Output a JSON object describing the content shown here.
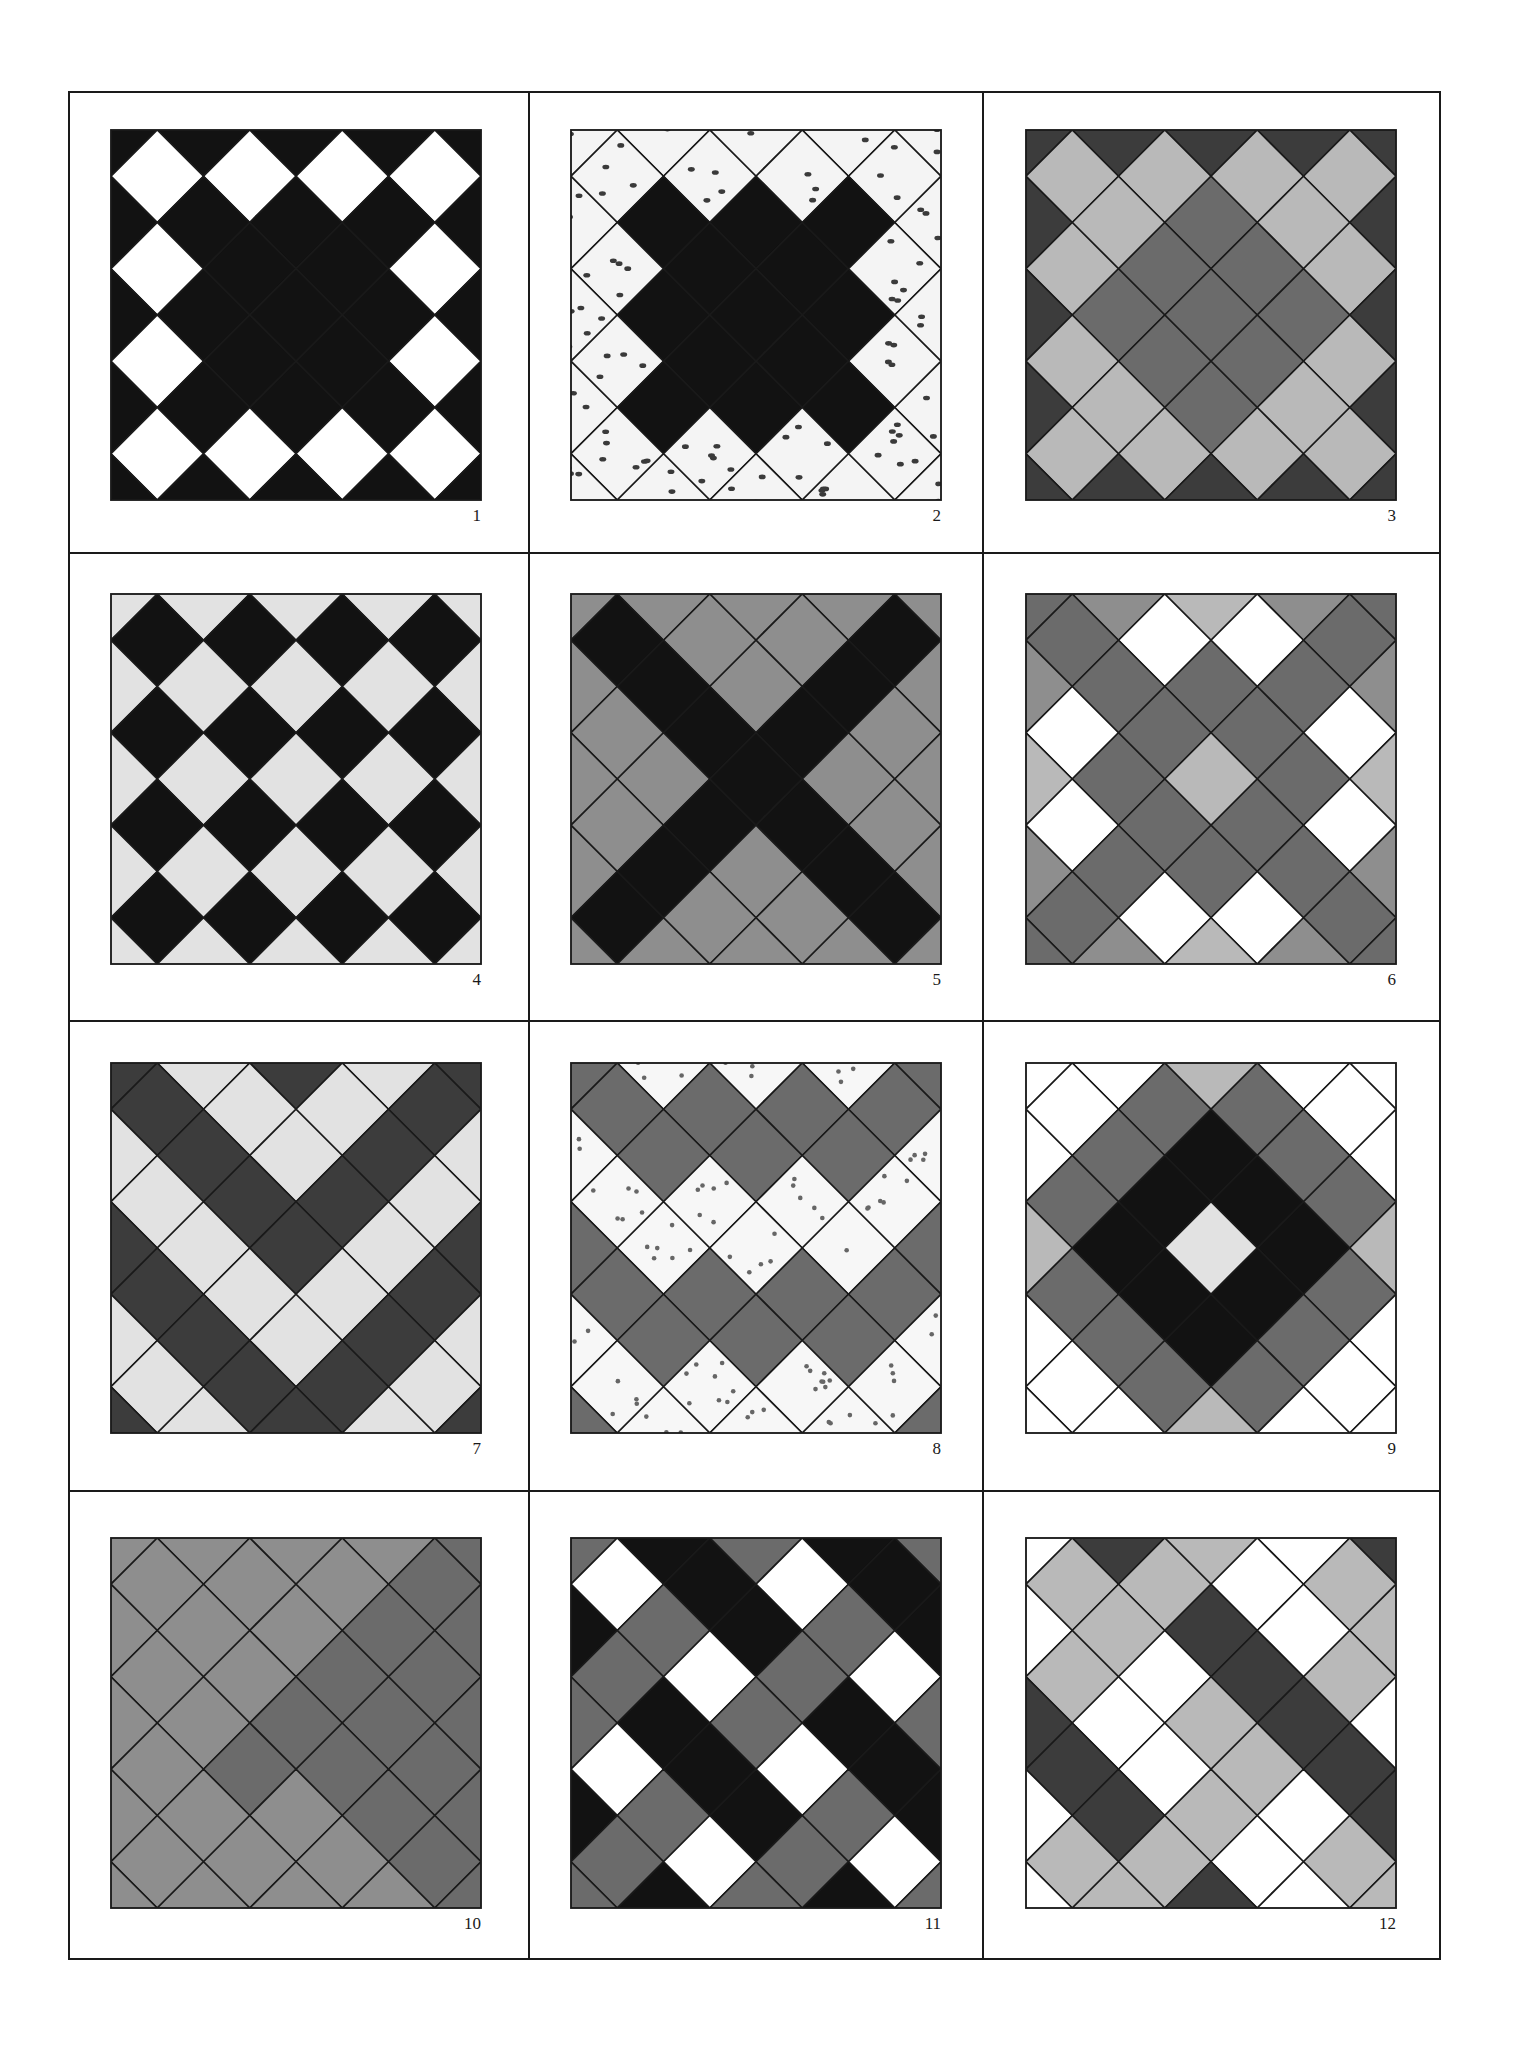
{
  "figure": {
    "palette": {
      "K": "#121212",
      "D": "#3c3c3c",
      "M": "#6b6b6b",
      "G": "#8e8e8e",
      "L": "#b9b9b9",
      "P": "#e2e2e2",
      "W": "#ffffff",
      "S": "#f4f4f4",
      "T": "#f7f7f7"
    },
    "legend_note": "Grid rows list lattice cells u=0..8 at row v; '.' = no cell at that lattice point",
    "tiles": [
      {
        "number": "1",
        "pattern": "black ground with ring of white diamonds",
        "rows": [
          "K.K.K.K.K",
          ".W.W.W.W.",
          "K.K.K.K.K",
          ".W.K.K.W.",
          "K.K.K.K.K",
          ".W.K.K.W.",
          "K.K.K.K.K",
          ".W.W.W.W.",
          "K.K.K.K.K"
        ]
      },
      {
        "number": "2",
        "pattern": "dark cross on spotted ground",
        "rows": [
          "S.S.S.S.S",
          ".S.S.S.S.",
          "S.K.K.K.S",
          ".S.K.K.S.",
          "S.K.K.K.S",
          ".S.K.K.S.",
          "S.K.K.K.S",
          ".S.S.S.S.",
          "S.S.S.S.S"
        ]
      },
      {
        "number": "3",
        "pattern": "grey diamond center with light ring on dark edges",
        "rows": [
          "D.D.D.D.D",
          ".L.L.L.L.",
          "D.L.M.L.D",
          ".L.M.M.L.",
          "D.M.M.M.D",
          ".L.M.M.L.",
          "D.L.M.L.D",
          ".L.L.L.L.",
          "D.D.D.D.D"
        ]
      },
      {
        "number": "4",
        "pattern": "black and light checkerboard",
        "rows": [
          "P.P.P.P.P",
          ".K.K.K.K.",
          "P.P.P.P.P",
          ".K.K.K.K.",
          "P.P.P.P.P",
          ".K.K.K.K.",
          "P.P.P.P.P",
          ".K.K.K.K.",
          "P.P.P.P.P"
        ]
      },
      {
        "number": "5",
        "pattern": "black X on grey ground",
        "rows": [
          "G.G.G.G.G",
          ".K.G.G.K.",
          "G.K.G.K.G",
          ".G.K.K.G.",
          "G.G.K.G.G",
          ".G.K.K.G.",
          "G.K.G.K.G",
          ".K.G.G.K.",
          "G.G.G.G.G"
        ]
      },
      {
        "number": "6",
        "pattern": "double grey X lattice with white diamonds",
        "rows": [
          "M.G.L.G.M",
          ".M.W.W.M.",
          "G.M.M.M.G",
          ".W.M.M.W.",
          "L.M.L.M.L",
          ".W.M.M.W.",
          "G.M.M.M.G",
          ".M.W.W.M.",
          "M.G.L.G.M"
        ]
      },
      {
        "number": "7",
        "pattern": "nested chevrons",
        "rows": [
          "D.P.D.P.D",
          ".D.P.P.D.",
          "P.D.P.D.P",
          ".P.D.D.P.",
          "D.P.D.P.D",
          ".D.P.P.D.",
          "P.D.P.D.P",
          ".P.D.D.P.",
          "D.P.D.P.D"
        ]
      },
      {
        "number": "8",
        "pattern": "two zigzag bands on spotted ground",
        "rows": [
          "M.T.T.T.M",
          ".M.M.M.M.",
          "T.M.M.M.T",
          ".T.T.T.T.",
          "M.T.T.T.M",
          ".M.M.M.M.",
          "T.M.M.M.T",
          ".T.T.T.T.",
          "M.T.T.T.M"
        ]
      },
      {
        "number": "9",
        "pattern": "concentric diamond rings",
        "rows": [
          "W.W.L.W.W",
          ".W.M.M.W.",
          "W.M.K.M.W",
          ".M.K.K.M.",
          "L.K.P.K.L",
          ".M.K.K.M.",
          "W.M.K.M.W",
          ".W.M.M.W.",
          "W.W.L.W.W"
        ]
      },
      {
        "number": "10",
        "pattern": "grey field with darker diagonal corner",
        "rows": [
          "G.G.G.G.M",
          ".G.G.G.M.",
          "G.G.G.M.M",
          ".G.G.M.M.",
          "G.G.M.M.M",
          ".G.M.M.M.",
          "G.G.G.M.M",
          ".G.G.G.M.",
          "G.G.G.G.M"
        ]
      },
      {
        "number": "11",
        "pattern": "woven plaid of black, grey and white",
        "rows": [
          "M.K.M.K.M",
          ".W.K.W.K.",
          "K.M.K.M.K",
          ".M.W.M.W.",
          "M.K.M.K.M",
          ".W.K.W.K.",
          "K.M.K.M.K",
          ".M.W.M.W.",
          "M.K.M.K.M"
        ]
      },
      {
        "number": "12",
        "pattern": "dark diagonal bands through light plaid",
        "rows": [
          "W.D.L.W.D",
          ".L.L.W.L.",
          "W.L.D.W.L",
          ".L.W.D.L.",
          "D.W.L.D.W",
          ".D.W.L.D.",
          "W.D.L.W.D",
          ".L.L.W.L.",
          "W.L.D.W.L"
        ]
      }
    ]
  }
}
